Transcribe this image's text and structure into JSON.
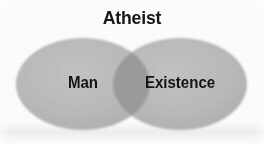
{
  "figure": {
    "title": "Atheist",
    "type": "venn-diagram",
    "background_color": "#fefefe",
    "title_color": "#161616"
  },
  "chart_data": {
    "type": "venn",
    "title": "Atheist",
    "sets": [
      {
        "id": "left",
        "label": "Man",
        "fill_color": "#b9b9b9",
        "cx": 83,
        "cy": 84,
        "rx": 67,
        "ry": 46
      },
      {
        "id": "right",
        "label": "Existence",
        "fill_color": "#b9b9b9",
        "cx": 180,
        "cy": 84,
        "rx": 67,
        "ry": 46
      }
    ],
    "intersection": {
      "label": "",
      "fill_color": "#9c9c9c"
    },
    "legend": "none",
    "grid": false
  }
}
